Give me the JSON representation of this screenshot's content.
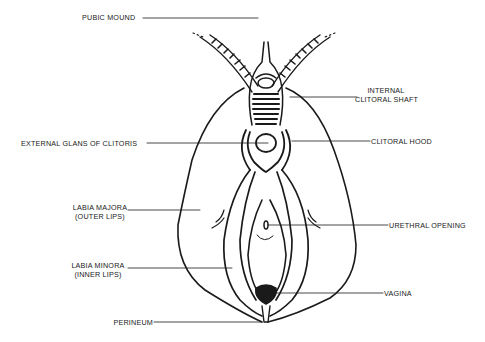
{
  "diagram": {
    "type": "anatomical-line-drawing",
    "labels": {
      "pubic_mound": "PUBIC MOUND",
      "internal_clitoral_shaft_line1": "INTERNAL",
      "internal_clitoral_shaft_line2": "CLITORAL SHAFT",
      "external_glans": "EXTERNAL GLANS OF CLITORIS",
      "clitoral_hood": "CLITORAL HOOD",
      "labia_majora_line1": "LABIA MAJORA",
      "labia_majora_line2": "(OUTER LIPS)",
      "urethral_opening": "URETHRAL OPENING",
      "labia_minora_line1": "LABIA MINORA",
      "labia_minora_line2": "(INNER LIPS)",
      "vagina": "VAGINA",
      "perineum": "PERINEUM"
    },
    "colors": {
      "ink": "#1a1a1a",
      "background": "#ffffff"
    }
  }
}
